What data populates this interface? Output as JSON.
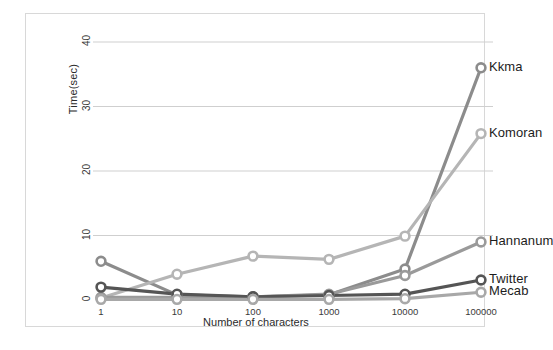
{
  "chart_data": {
    "type": "line",
    "title": "",
    "xlabel": "Number of characters",
    "ylabel": "Time(sec)",
    "x_tick_labels": [
      "1",
      "10",
      "100",
      "1000",
      "10000",
      "100000"
    ],
    "x_scale": "log-categorical",
    "y_ticks": [
      0,
      10,
      20,
      30,
      40
    ],
    "ylim": [
      0,
      40
    ],
    "grid": "horizontal",
    "legend_position": "right-inline-labels",
    "markers": "open-circle",
    "series": [
      {
        "name": "Kkma",
        "color": "#8c8c8c",
        "label_color": "#1c1c1c",
        "values": [
          6.0,
          0.8,
          0.5,
          0.8,
          4.8,
          36.0
        ]
      },
      {
        "name": "Komoran",
        "color": "#b5b5b5",
        "label_color": "#1c1c1c",
        "values": [
          0.3,
          4.0,
          6.8,
          6.3,
          9.9,
          25.8
        ]
      },
      {
        "name": "Hannanum",
        "color": "#9a9a9a",
        "label_color": "#1c1c1c",
        "values": [
          0.4,
          0.4,
          0.5,
          0.9,
          3.8,
          9.0
        ]
      },
      {
        "name": "Twitter",
        "color": "#555555",
        "label_color": "#1c1c1c",
        "values": [
          2.0,
          0.9,
          0.5,
          0.7,
          0.9,
          3.1
        ]
      },
      {
        "name": "Mecab",
        "color": "#a8a8a8",
        "label_color": "#1c1c1c",
        "values": [
          0.1,
          0.1,
          0.1,
          0.1,
          0.2,
          1.2
        ]
      }
    ]
  },
  "style": {
    "frame_border": "#d8d8d8",
    "grid_color": "#cfcfcf",
    "background": "#ffffff",
    "tick_text": "#3a3a3a",
    "axis_title": "#2b2b2b"
  }
}
